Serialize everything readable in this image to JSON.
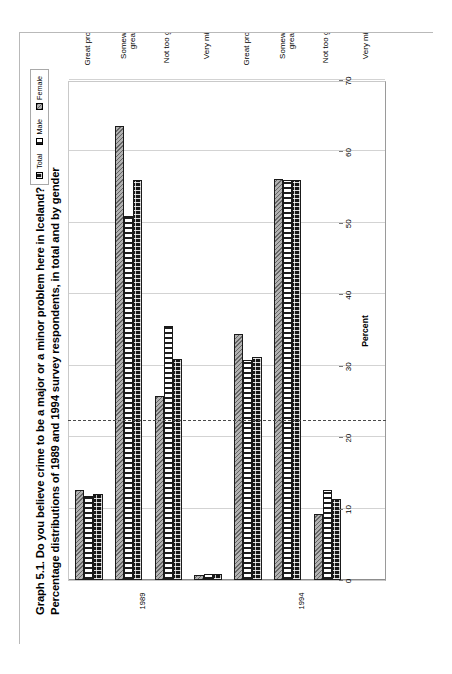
{
  "figure": {
    "title_line_1": "Graph 5.1.  Do you believe crime to be a major or a minor problem here in Iceland?",
    "title_line_2": "Percentage distributions of 1989 and 1994 survey respondents, in total and by gender"
  },
  "legend": {
    "items": [
      {
        "label": "Total",
        "pattern": "dotted-black",
        "color": "#161616"
      },
      {
        "label": "Male",
        "pattern": "vertical-stripes",
        "color": "#ffffff"
      },
      {
        "label": "Female",
        "pattern": "diagonal-hatch",
        "color": "#8f8f8f"
      }
    ]
  },
  "periods": [
    {
      "label": "1989"
    },
    {
      "label": "1994"
    }
  ],
  "chart_data": {
    "type": "bar",
    "orientation": "horizontal",
    "title": "Graph 5.1.  Do you believe crime to be a major or a minor problem here in Iceland?",
    "subtitle": "Percentage distributions of 1989 and 1994 survey respondents, in total and by gender",
    "xlabel": "Percent",
    "ylabel": "",
    "xlim": [
      0,
      70
    ],
    "xticks": [
      0,
      10,
      20,
      30,
      40,
      50,
      60,
      70
    ],
    "grid": "vertical",
    "legend_position": "top-right",
    "groups": [
      {
        "period": "1989",
        "categories": [
          "Great problem",
          "Somewhat great",
          "Not too great",
          "Very minor"
        ],
        "series": [
          {
            "name": "Total",
            "values": [
              12.0,
              56.0,
              31.0,
              0.8
            ]
          },
          {
            "name": "Male",
            "values": [
              11.8,
              51.0,
              35.5,
              0.9
            ]
          },
          {
            "name": "Female",
            "values": [
              12.6,
              63.5,
              25.8,
              0.7
            ]
          }
        ]
      },
      {
        "period": "1994",
        "categories": [
          "Great problem",
          "Somewhat great",
          "Not too great",
          "Very minor"
        ],
        "series": [
          {
            "name": "Total",
            "values": [
              31.2,
              56.0,
              11.3,
              0.0
            ]
          },
          {
            "name": "Male",
            "values": [
              30.8,
              56.0,
              12.6,
              0.0
            ]
          },
          {
            "name": "Female",
            "values": [
              34.4,
              56.2,
              9.2,
              0.0
            ]
          }
        ]
      }
    ],
    "category_order_on_axis": [
      "Great problem",
      "Somewhat great",
      "Not too great",
      "Very minor",
      "Great problem",
      "Somewhat great",
      "Not too great",
      "Very minor"
    ]
  }
}
